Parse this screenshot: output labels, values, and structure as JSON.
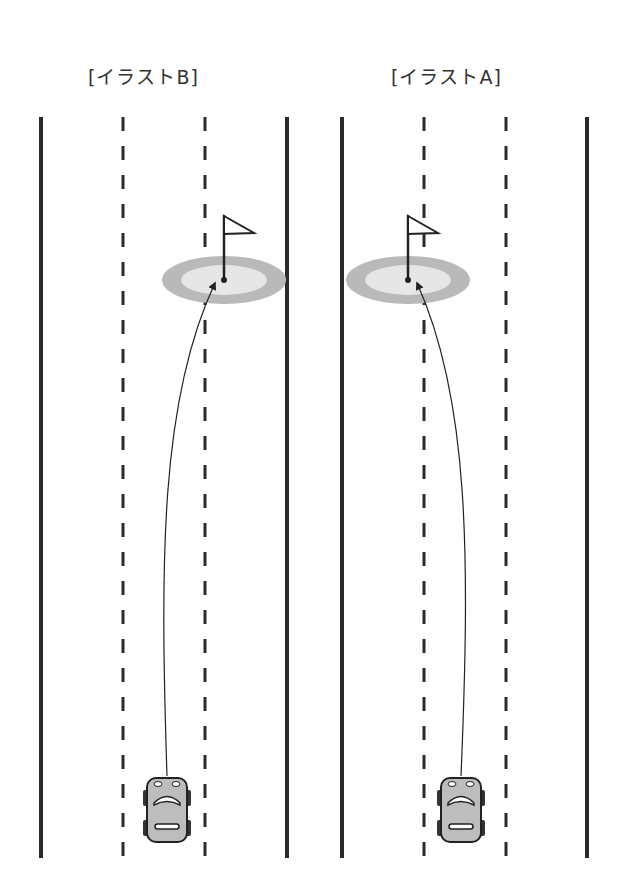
{
  "panels": [
    {
      "id": "B",
      "title": "[イラストB]",
      "title_x": 88,
      "road": {
        "left_edge": 41,
        "right_edge": 287,
        "lane_lines": [
          123,
          205
        ]
      },
      "target": {
        "cx": 224,
        "cy": 280,
        "flag_x": 224
      },
      "car": {
        "x": 147,
        "y": 778
      },
      "path": "M167 776 C 160 560, 160 400, 215 283"
    },
    {
      "id": "A",
      "title": "[イラストA]",
      "title_x": 391,
      "road": {
        "left_edge": 342,
        "right_edge": 587,
        "lane_lines": [
          424,
          506
        ]
      },
      "target": {
        "cx": 408,
        "cy": 280,
        "flag_x": 408
      },
      "car": {
        "x": 441,
        "y": 778
      },
      "path": "M461 776 C 470 560, 470 400, 417 283"
    }
  ],
  "colors": {
    "line": "#2b2b2b",
    "green_outer": "#b9b9b9",
    "green_inner": "#e6e6e6",
    "car_body": "#bdbdbd"
  }
}
